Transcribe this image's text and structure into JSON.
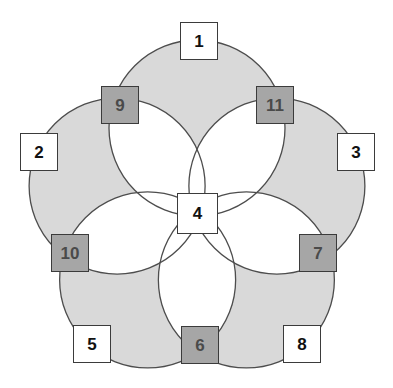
{
  "diagram": {
    "type": "venn-rosette",
    "canvas": {
      "width": 393,
      "height": 388
    },
    "colors": {
      "background": "#ffffff",
      "petal_fill": "#ffffff",
      "circle_fill": "#d9d9d9",
      "circle_stroke": "#4d4d4d",
      "node_white_fill": "#ffffff",
      "node_gray_fill": "#a6a6a6",
      "node_border": "#3b3b3b",
      "node_white_text": "#111111",
      "node_gray_text": "#4a4a4a"
    },
    "geometry": {
      "center": {
        "x": 197,
        "y": 212
      },
      "circle_radius": 88,
      "circle_center_offset": 84,
      "start_angle_deg": -90,
      "circle_count": 5
    },
    "nodes": [
      {
        "id": "1",
        "label": "1",
        "style": "white",
        "x": 180,
        "y": 22,
        "w": 38,
        "h": 38,
        "font": 17,
        "role": "outer-apex"
      },
      {
        "id": "2",
        "label": "2",
        "style": "white",
        "x": 20,
        "y": 133,
        "w": 38,
        "h": 38,
        "font": 17,
        "role": "outer-apex"
      },
      {
        "id": "3",
        "label": "3",
        "style": "white",
        "x": 337,
        "y": 133,
        "w": 38,
        "h": 38,
        "font": 17,
        "role": "outer-apex"
      },
      {
        "id": "4",
        "label": "4",
        "style": "white",
        "x": 177,
        "y": 193,
        "w": 41,
        "h": 41,
        "font": 17,
        "role": "center"
      },
      {
        "id": "5",
        "label": "5",
        "style": "white",
        "x": 73,
        "y": 325,
        "w": 38,
        "h": 38,
        "font": 17,
        "role": "outer-apex"
      },
      {
        "id": "6",
        "label": "6",
        "style": "gray",
        "x": 181,
        "y": 326,
        "w": 38,
        "h": 38,
        "font": 17,
        "role": "intersection"
      },
      {
        "id": "7",
        "label": "7",
        "style": "gray",
        "x": 299,
        "y": 234,
        "w": 38,
        "h": 38,
        "font": 17,
        "role": "intersection"
      },
      {
        "id": "8",
        "label": "8",
        "style": "white",
        "x": 283,
        "y": 325,
        "w": 38,
        "h": 38,
        "font": 17,
        "role": "outer-apex"
      },
      {
        "id": "9",
        "label": "9",
        "style": "gray",
        "x": 101,
        "y": 86,
        "w": 38,
        "h": 38,
        "font": 17,
        "role": "intersection"
      },
      {
        "id": "10",
        "label": "10",
        "style": "gray",
        "x": 51,
        "y": 234,
        "w": 38,
        "h": 38,
        "font": 17,
        "role": "intersection"
      },
      {
        "id": "11",
        "label": "11",
        "style": "gray",
        "x": 256,
        "y": 86,
        "w": 38,
        "h": 38,
        "font": 17,
        "role": "intersection"
      }
    ]
  }
}
